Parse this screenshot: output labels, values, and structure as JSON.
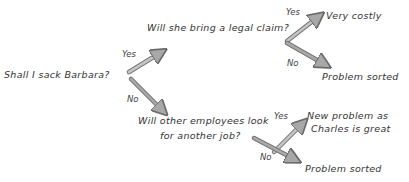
{
  "diagram": {
    "type": "decision-tree",
    "root": {
      "id": "q1",
      "text": "Shall I sack Barbara?"
    },
    "nodes": {
      "q2": {
        "text": "Will she bring a legal claim?"
      },
      "q3": {
        "line1": "Will other employees look",
        "line2": "for another job?"
      },
      "o1": {
        "text": "Very costly"
      },
      "o2": {
        "text": "Problem sorted"
      },
      "o3": {
        "line1": "New problem as",
        "line2": "Charles is great"
      },
      "o4": {
        "text": "Problem sorted"
      }
    },
    "edges": [
      {
        "from": "q1",
        "to": "q2",
        "label": "Yes"
      },
      {
        "from": "q1",
        "to": "q3",
        "label": "No"
      },
      {
        "from": "q2",
        "to": "o1",
        "label": "Yes"
      },
      {
        "from": "q2",
        "to": "o2",
        "label": "No"
      },
      {
        "from": "q3",
        "to": "o3",
        "label": "Yes"
      },
      {
        "from": "q3",
        "to": "o4",
        "label": "No"
      }
    ],
    "colors": {
      "arrow_fill": "#a8a8a8",
      "arrow_stroke": "#6a6a6a",
      "text": "#333333"
    }
  }
}
